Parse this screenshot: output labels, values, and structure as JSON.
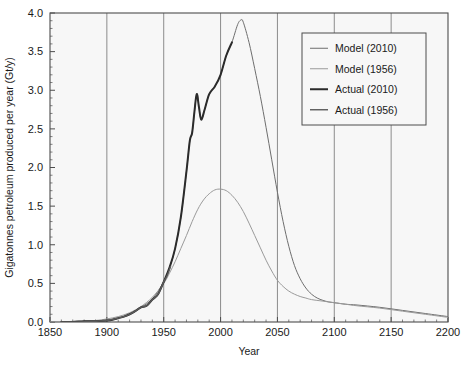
{
  "chart_data": {
    "type": "line",
    "title": "",
    "xlabel": "Year",
    "ylabel": "Gigatonnes petroleum produced per year (Gt/y)",
    "xlim": [
      1850,
      2200
    ],
    "ylim": [
      0.0,
      4.0
    ],
    "xticks": [
      1850,
      1900,
      1950,
      2000,
      2050,
      2100,
      2150,
      2200
    ],
    "xtick_labels": [
      "1850",
      "1900",
      "1950",
      "2000",
      "2050",
      "2100",
      "2150",
      "2200"
    ],
    "yticks": [
      0.0,
      0.5,
      1.0,
      1.5,
      2.0,
      2.5,
      3.0,
      3.5,
      4.0
    ],
    "ytick_labels": [
      "0.0",
      "0.5",
      "1.0",
      "1.5",
      "2.0",
      "2.5",
      "3.0",
      "3.5",
      "4.0"
    ],
    "x_minor_tick_step": 10,
    "y_minor_tick_step": 0.1,
    "grid": "vertical-major",
    "grid_color": "#808080",
    "plot_background": "#f7f7f7",
    "frame_color": "#4d4d4d",
    "legend_position": "upper-right",
    "legend_entries": [
      {
        "label": "Model (2010)",
        "color": "#6e6e6e",
        "width": 1.0
      },
      {
        "label": "Model (1956)",
        "color": "#9a9a9a",
        "width": 1.0
      },
      {
        "label": "Actual (2010)",
        "color": "#2b2b2b",
        "width": 2.0
      },
      {
        "label": "Actual (1956)",
        "color": "#5a5a5a",
        "width": 1.4
      }
    ],
    "series": [
      {
        "name": "Model (2010)",
        "color": "#6e6e6e",
        "width": 1.0,
        "points": [
          [
            1850,
            0.0
          ],
          [
            1870,
            0.0
          ],
          [
            1890,
            0.01
          ],
          [
            1900,
            0.02
          ],
          [
            1910,
            0.05
          ],
          [
            1920,
            0.1
          ],
          [
            1930,
            0.19
          ],
          [
            1940,
            0.3
          ],
          [
            1950,
            0.52
          ],
          [
            1955,
            0.7
          ],
          [
            1960,
            0.95
          ],
          [
            1965,
            1.35
          ],
          [
            1970,
            1.95
          ],
          [
            1973,
            2.35
          ],
          [
            1975,
            2.45
          ],
          [
            1979,
            2.95
          ],
          [
            1981,
            2.78
          ],
          [
            1983,
            2.62
          ],
          [
            1986,
            2.75
          ],
          [
            1990,
            2.95
          ],
          [
            1995,
            3.05
          ],
          [
            2000,
            3.2
          ],
          [
            2005,
            3.45
          ],
          [
            2010,
            3.62
          ],
          [
            2015,
            3.85
          ],
          [
            2018,
            3.91
          ],
          [
            2020,
            3.88
          ],
          [
            2025,
            3.62
          ],
          [
            2030,
            3.28
          ],
          [
            2035,
            2.92
          ],
          [
            2040,
            2.52
          ],
          [
            2045,
            2.1
          ],
          [
            2050,
            1.68
          ],
          [
            2055,
            1.3
          ],
          [
            2060,
            0.98
          ],
          [
            2065,
            0.73
          ],
          [
            2070,
            0.56
          ],
          [
            2075,
            0.44
          ],
          [
            2080,
            0.36
          ],
          [
            2085,
            0.31
          ],
          [
            2090,
            0.28
          ],
          [
            2095,
            0.26
          ],
          [
            2100,
            0.25
          ],
          [
            2110,
            0.23
          ],
          [
            2120,
            0.22
          ],
          [
            2140,
            0.19
          ],
          [
            2160,
            0.15
          ],
          [
            2180,
            0.11
          ],
          [
            2200,
            0.07
          ]
        ]
      },
      {
        "name": "Model (1956)",
        "color": "#9a9a9a",
        "width": 1.0,
        "points": [
          [
            1850,
            0.0
          ],
          [
            1875,
            0.01
          ],
          [
            1890,
            0.02
          ],
          [
            1900,
            0.04
          ],
          [
            1910,
            0.07
          ],
          [
            1920,
            0.12
          ],
          [
            1930,
            0.2
          ],
          [
            1940,
            0.32
          ],
          [
            1950,
            0.5
          ],
          [
            1955,
            0.63
          ],
          [
            1960,
            0.78
          ],
          [
            1965,
            0.95
          ],
          [
            1970,
            1.12
          ],
          [
            1975,
            1.3
          ],
          [
            1980,
            1.46
          ],
          [
            1985,
            1.58
          ],
          [
            1990,
            1.66
          ],
          [
            1995,
            1.71
          ],
          [
            2000,
            1.72
          ],
          [
            2005,
            1.7
          ],
          [
            2010,
            1.64
          ],
          [
            2015,
            1.55
          ],
          [
            2020,
            1.43
          ],
          [
            2025,
            1.28
          ],
          [
            2030,
            1.12
          ],
          [
            2035,
            0.96
          ],
          [
            2040,
            0.8
          ],
          [
            2045,
            0.66
          ],
          [
            2050,
            0.54
          ],
          [
            2055,
            0.46
          ],
          [
            2060,
            0.4
          ],
          [
            2065,
            0.36
          ],
          [
            2070,
            0.33
          ],
          [
            2075,
            0.31
          ],
          [
            2080,
            0.29
          ],
          [
            2090,
            0.27
          ],
          [
            2100,
            0.25
          ],
          [
            2110,
            0.23
          ],
          [
            2120,
            0.21
          ],
          [
            2140,
            0.18
          ],
          [
            2160,
            0.14
          ],
          [
            2180,
            0.1
          ],
          [
            2200,
            0.06
          ]
        ]
      },
      {
        "name": "Actual (2010)",
        "color": "#2b2b2b",
        "width": 2.0,
        "points": [
          [
            1860,
            0.0
          ],
          [
            1870,
            0.0
          ],
          [
            1880,
            0.01
          ],
          [
            1890,
            0.01
          ],
          [
            1900,
            0.02
          ],
          [
            1905,
            0.03
          ],
          [
            1910,
            0.05
          ],
          [
            1915,
            0.07
          ],
          [
            1920,
            0.1
          ],
          [
            1925,
            0.14
          ],
          [
            1930,
            0.19
          ],
          [
            1935,
            0.21
          ],
          [
            1940,
            0.29
          ],
          [
            1945,
            0.36
          ],
          [
            1950,
            0.52
          ],
          [
            1955,
            0.7
          ],
          [
            1960,
            0.95
          ],
          [
            1965,
            1.35
          ],
          [
            1970,
            1.95
          ],
          [
            1973,
            2.35
          ],
          [
            1975,
            2.45
          ],
          [
            1977,
            2.72
          ],
          [
            1979,
            2.95
          ],
          [
            1981,
            2.78
          ],
          [
            1983,
            2.62
          ],
          [
            1986,
            2.75
          ],
          [
            1990,
            2.95
          ],
          [
            1995,
            3.05
          ],
          [
            2000,
            3.2
          ],
          [
            2005,
            3.45
          ],
          [
            2010,
            3.62
          ]
        ]
      },
      {
        "name": "Actual (1956)",
        "color": "#5a5a5a",
        "width": 1.4,
        "points": [
          [
            1860,
            0.0
          ],
          [
            1875,
            0.0
          ],
          [
            1890,
            0.01
          ],
          [
            1900,
            0.02
          ],
          [
            1910,
            0.05
          ],
          [
            1915,
            0.07
          ],
          [
            1920,
            0.1
          ],
          [
            1925,
            0.14
          ],
          [
            1930,
            0.19
          ],
          [
            1935,
            0.21
          ],
          [
            1940,
            0.29
          ],
          [
            1945,
            0.36
          ],
          [
            1950,
            0.52
          ],
          [
            1953,
            0.6
          ],
          [
            1956,
            0.72
          ]
        ]
      }
    ]
  },
  "geometry": {
    "plot_left": 50,
    "plot_right": 448,
    "plot_top": 13,
    "plot_bottom": 322
  }
}
